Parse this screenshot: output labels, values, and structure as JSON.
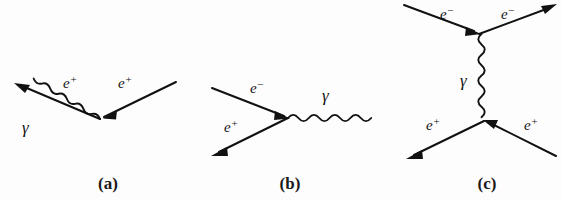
{
  "figure": {
    "background_color": "#fdfdfd",
    "line_color": "#111111",
    "width": 562,
    "height": 201
  },
  "diagrams": [
    {
      "caption": "(a)",
      "caption_x": 108,
      "caption_y": 188,
      "vertex": {
        "x": 100,
        "y": 119
      },
      "lines": [
        {
          "name": "incoming-positron",
          "type": "fermion",
          "label": "e",
          "charge": "+",
          "label_x": 118,
          "label_y": 88,
          "from": {
            "x": 176,
            "y": 82
          },
          "to": {
            "x": 100,
            "y": 119
          },
          "arrow_direction": "toward-vertex"
        },
        {
          "name": "outgoing-positron",
          "type": "fermion",
          "label": "e",
          "charge": "+",
          "label_x": 63,
          "label_y": 88,
          "from": {
            "x": 100,
            "y": 119
          },
          "to": {
            "x": 16,
            "y": 84
          },
          "arrow_direction": "away-from-vertex"
        },
        {
          "name": "emitted-photon",
          "type": "photon",
          "label": "γ",
          "label_x": 24,
          "label_y": 130,
          "from": {
            "x": 100,
            "y": 120
          },
          "to": {
            "x": 20,
            "y": 153
          }
        }
      ]
    },
    {
      "caption": "(b)",
      "caption_x": 290,
      "caption_y": 188,
      "vertex": {
        "x": 288,
        "y": 118
      },
      "lines": [
        {
          "name": "incoming-electron",
          "type": "fermion",
          "label": "e",
          "charge": "−",
          "label_x": 252,
          "label_y": 92,
          "from": {
            "x": 212,
            "y": 88
          },
          "to": {
            "x": 288,
            "y": 118
          },
          "arrow_direction": "toward-vertex"
        },
        {
          "name": "outgoing-positron",
          "type": "fermion",
          "label": "e",
          "charge": "+",
          "label_x": 226,
          "label_y": 130,
          "from": {
            "x": 288,
            "y": 118
          },
          "to": {
            "x": 213,
            "y": 155
          },
          "arrow_direction": "away-from-vertex"
        },
        {
          "name": "annihilation-photon",
          "type": "photon",
          "label": "γ",
          "label_x": 324,
          "label_y": 98,
          "from": {
            "x": 288,
            "y": 118
          },
          "to": {
            "x": 376,
            "y": 118
          }
        }
      ]
    },
    {
      "caption": "(c)",
      "caption_x": 487,
      "caption_y": 188,
      "vertex_top": {
        "x": 479,
        "y": 34
      },
      "vertex_bottom": {
        "x": 484,
        "y": 121
      },
      "lines": [
        {
          "name": "incoming-electron",
          "type": "fermion",
          "label": "e",
          "charge": "−",
          "label_x": 443,
          "label_y": 18,
          "from": {
            "x": 404,
            "y": 5
          },
          "to": {
            "x": 479,
            "y": 34
          },
          "arrow_direction": "toward-vertex"
        },
        {
          "name": "outgoing-electron",
          "type": "fermion",
          "label": "e",
          "charge": "−",
          "label_x": 504,
          "label_y": 18,
          "from": {
            "x": 479,
            "y": 34
          },
          "to": {
            "x": 556,
            "y": 4
          },
          "arrow_direction": "away-from-vertex"
        },
        {
          "name": "exchange-photon",
          "type": "photon",
          "label": "γ",
          "label_x": 463,
          "label_y": 83,
          "from": {
            "x": 480,
            "y": 36
          },
          "to": {
            "x": 484,
            "y": 119
          }
        },
        {
          "name": "incoming-positron",
          "type": "fermion",
          "label": "e",
          "charge": "+",
          "label_x": 528,
          "label_y": 128,
          "from": {
            "x": 556,
            "y": 156
          },
          "to": {
            "x": 484,
            "y": 121
          },
          "arrow_direction": "toward-vertex"
        },
        {
          "name": "outgoing-positron",
          "type": "fermion",
          "label": "e",
          "charge": "+",
          "label_x": 430,
          "label_y": 128,
          "from": {
            "x": 484,
            "y": 121
          },
          "to": {
            "x": 408,
            "y": 158
          },
          "arrow_direction": "away-from-vertex"
        }
      ]
    }
  ]
}
